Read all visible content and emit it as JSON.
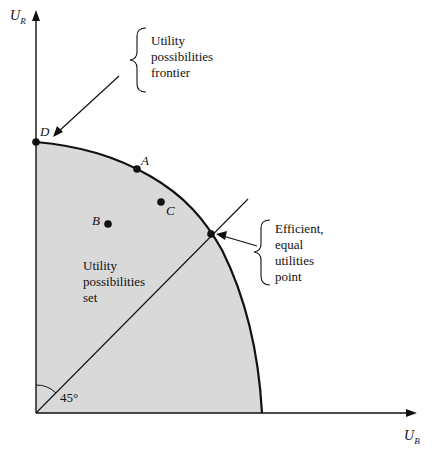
{
  "diagram": {
    "title": "",
    "axes": {
      "x_label": "U",
      "x_sub": "B",
      "y_label": "U",
      "y_sub": "R"
    },
    "regions": {
      "set_label": "Utility\npossibilities\nset",
      "fill_color": "#d9d9d9"
    },
    "points": [
      {
        "id": "D",
        "label": "D"
      },
      {
        "id": "A",
        "label": "A"
      },
      {
        "id": "C",
        "label": "C"
      },
      {
        "id": "B",
        "label": "B"
      }
    ],
    "angle_label": "45°",
    "callouts": {
      "frontier": "Utility\npossibilities\nfrontier",
      "efficient": "Efficient,\nequal\nutilities\npoint"
    },
    "colors": {
      "line": "#111111",
      "fill": "#d9d9d9",
      "background": "#ffffff"
    }
  }
}
